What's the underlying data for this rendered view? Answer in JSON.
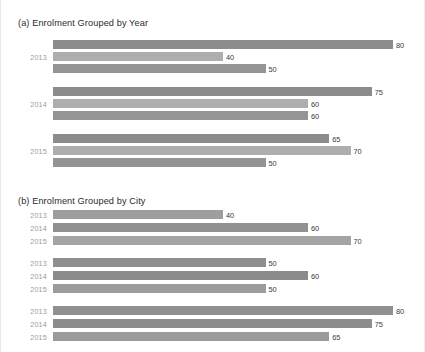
{
  "chart_data": [
    {
      "type": "bar",
      "orientation": "horizontal",
      "title": "(a) Enrolment Grouped by Year",
      "xlabel": "",
      "ylabel": "",
      "xlim": [
        0,
        80
      ],
      "grid": false,
      "legend": "none",
      "categories": [
        "2013",
        "2014",
        "2015"
      ],
      "series": [
        {
          "name": "series-1",
          "values": [
            80,
            75,
            65
          ],
          "color": "#8c8c8c"
        },
        {
          "name": "series-2",
          "values": [
            40,
            60,
            70
          ],
          "color": "#aaaaaa"
        },
        {
          "name": "series-3",
          "values": [
            50,
            60,
            50
          ],
          "color": "#949494"
        }
      ]
    },
    {
      "type": "bar",
      "orientation": "horizontal",
      "title": "(b) Enrolment Grouped by City",
      "xlabel": "",
      "ylabel": "",
      "xlim": [
        0,
        80
      ],
      "grid": false,
      "legend": "none",
      "categories": [
        "group-1",
        "group-2",
        "group-3"
      ],
      "subcategories": [
        "2013",
        "2014",
        "2015"
      ],
      "series": [
        {
          "name": "2013",
          "values": [
            40,
            50,
            80
          ],
          "color": "#9a9a9a"
        },
        {
          "name": "2014",
          "values": [
            60,
            60,
            75
          ],
          "color": "#8f8f8f"
        },
        {
          "name": "2015",
          "values": [
            70,
            50,
            65
          ],
          "color": "#a2a2a2"
        }
      ]
    }
  ],
  "chart_a": {
    "title": "(a) Enrolment Grouped by Year",
    "groups": [
      {
        "label": "2013",
        "bars": [
          {
            "value": 80,
            "label": "80",
            "color": "#8c8c8c"
          },
          {
            "value": 40,
            "label": "40",
            "color": "#aeaeae"
          },
          {
            "value": 50,
            "label": "50",
            "color": "#949494"
          }
        ]
      },
      {
        "label": "2014",
        "bars": [
          {
            "value": 75,
            "label": "75",
            "color": "#8c8c8c"
          },
          {
            "value": 60,
            "label": "60",
            "color": "#aeaeae"
          },
          {
            "value": 60,
            "label": "60",
            "color": "#949494"
          }
        ]
      },
      {
        "label": "2015",
        "bars": [
          {
            "value": 65,
            "label": "65",
            "color": "#8c8c8c"
          },
          {
            "value": 70,
            "label": "70",
            "color": "#aeaeae"
          },
          {
            "value": 50,
            "label": "50",
            "color": "#949494"
          }
        ]
      }
    ]
  },
  "chart_b": {
    "title": "(b) Enrolment Grouped by City",
    "groups": [
      {
        "bars": [
          {
            "label_y": "2013",
            "value": 40,
            "label": "40",
            "color": "#9e9e9e"
          },
          {
            "label_y": "2014",
            "value": 60,
            "label": "60",
            "color": "#919191"
          },
          {
            "label_y": "2015",
            "value": 70,
            "label": "70",
            "color": "#a4a4a4"
          }
        ]
      },
      {
        "bars": [
          {
            "label_y": "2013",
            "value": 50,
            "label": "50",
            "color": "#8f8f8f"
          },
          {
            "label_y": "2014",
            "value": 60,
            "label": "60",
            "color": "#8b8b8b"
          },
          {
            "label_y": "2015",
            "value": 50,
            "label": "50",
            "color": "#9c9c9c"
          }
        ]
      },
      {
        "bars": [
          {
            "label_y": "2013",
            "value": 80,
            "label": "80",
            "color": "#909090"
          },
          {
            "label_y": "2014",
            "value": 75,
            "label": "75",
            "color": "#8d8d8d"
          },
          {
            "label_y": "2015",
            "value": 65,
            "label": "65",
            "color": "#9b9b9b"
          }
        ]
      }
    ]
  },
  "scale": {
    "px_per_unit": 4.25,
    "bar_origin_px": 52
  }
}
